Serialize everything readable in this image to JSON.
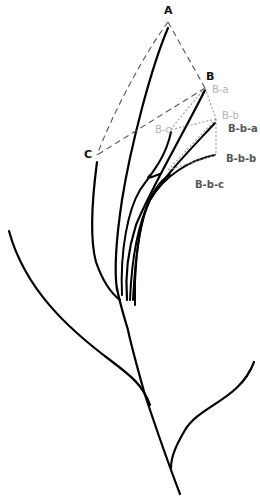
{
  "diagram": {
    "type": "branching plant / hierarchy diagram",
    "nodes": {
      "A": "A",
      "B": "B",
      "C": "C",
      "B_a": "B-a",
      "B_b": "B-b",
      "B_c": "B-c",
      "B_b_a": "B-b-a",
      "B_b_b": "B-b-b",
      "B_b_c": "B-b-c"
    },
    "colors": {
      "stem": "#000000",
      "dashed_link": "#555555",
      "dotted_link": "#999999",
      "primary_label": "#111111",
      "secondary_label": "#b4b4b4",
      "tertiary_label": "#555555"
    }
  }
}
